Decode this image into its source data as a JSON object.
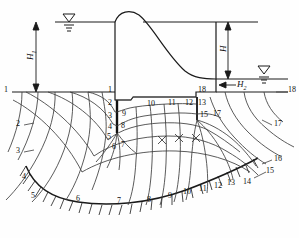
{
  "figure": {
    "kind": "seepage-flow-net-under-gravity-dam"
  },
  "dimensions": {
    "upstream_head_label": "H",
    "upstream_head_sub": "1",
    "total_head_label": "H",
    "downstream_head_label": "H",
    "downstream_head_sub": "2"
  },
  "symbols": {
    "water_table_upstream": "water-level-triangle",
    "water_table_downstream": "water-level-triangle"
  },
  "boundary_labels": {
    "upstream_surface_left": "1",
    "downstream_surface_right": "18"
  },
  "equipotential_numbers_left_outside": [
    "2",
    "3",
    "4",
    "5"
  ],
  "equipotential_numbers_right_outside": [
    "17",
    "16",
    "15",
    "14"
  ],
  "upstream_cutoff_numbers": [
    "1",
    "2",
    "3",
    "4",
    "5",
    "6",
    "7",
    "8",
    "9"
  ],
  "base_numbers": [
    "10",
    "11",
    "12"
  ],
  "downstream_cutoff_numbers": [
    "13",
    "15",
    "17",
    "18"
  ],
  "impervious_base_numbers": [
    "3",
    "4",
    "5",
    "6",
    "7",
    "8",
    "9",
    "10",
    "11",
    "12",
    "13",
    "14",
    "15",
    "16"
  ],
  "colors": {
    "line": "#1a1a1a",
    "flownet": "#4a4a4a",
    "background": "#fefefe"
  },
  "annotations": {
    "square_check_marks": [
      "x",
      "x",
      "x"
    ]
  }
}
